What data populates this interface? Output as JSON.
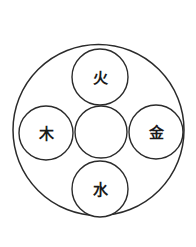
{
  "diagram": {
    "background_color": "#ffffff",
    "stroke_color": "#2b2b2b",
    "label_color": "#1a1a1a",
    "outer_circle": {
      "name": "outer-boundary-circle",
      "cx": 98.5,
      "cy": 130,
      "r": 85.5,
      "label": ""
    },
    "nodes": [
      {
        "id": "fire",
        "position": "top",
        "label": "火",
        "cx": 100,
        "cy": 77,
        "r": 28
      },
      {
        "id": "wood",
        "position": "left",
        "label": "木",
        "cx": 46,
        "cy": 133,
        "r": 27
      },
      {
        "id": "earth-center",
        "position": "center",
        "label": "",
        "cx": 101,
        "cy": 132,
        "r": 26
      },
      {
        "id": "metal",
        "position": "right",
        "label": "金",
        "cx": 156,
        "cy": 132,
        "r": 27
      },
      {
        "id": "water",
        "position": "bottom",
        "label": "水",
        "cx": 100,
        "cy": 189,
        "r": 28
      }
    ]
  }
}
